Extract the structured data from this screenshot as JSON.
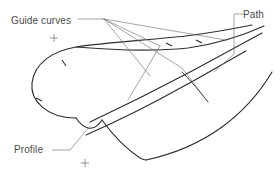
{
  "diagram": {
    "kind": "cad-swept-surface-construction",
    "background_color": "#ffffff",
    "curve_color": "#2e2e2e",
    "leader_color": "#6a6a6a",
    "text_color": "#4a4a4a",
    "width": 280,
    "height": 177,
    "callouts": [
      {
        "id": "guide-curves",
        "label": "Guide curves"
      },
      {
        "id": "path",
        "label": "Path"
      },
      {
        "id": "profile",
        "label": "Profile"
      }
    ],
    "markers": {
      "cross_count": 2,
      "tick_count": 4
    }
  }
}
